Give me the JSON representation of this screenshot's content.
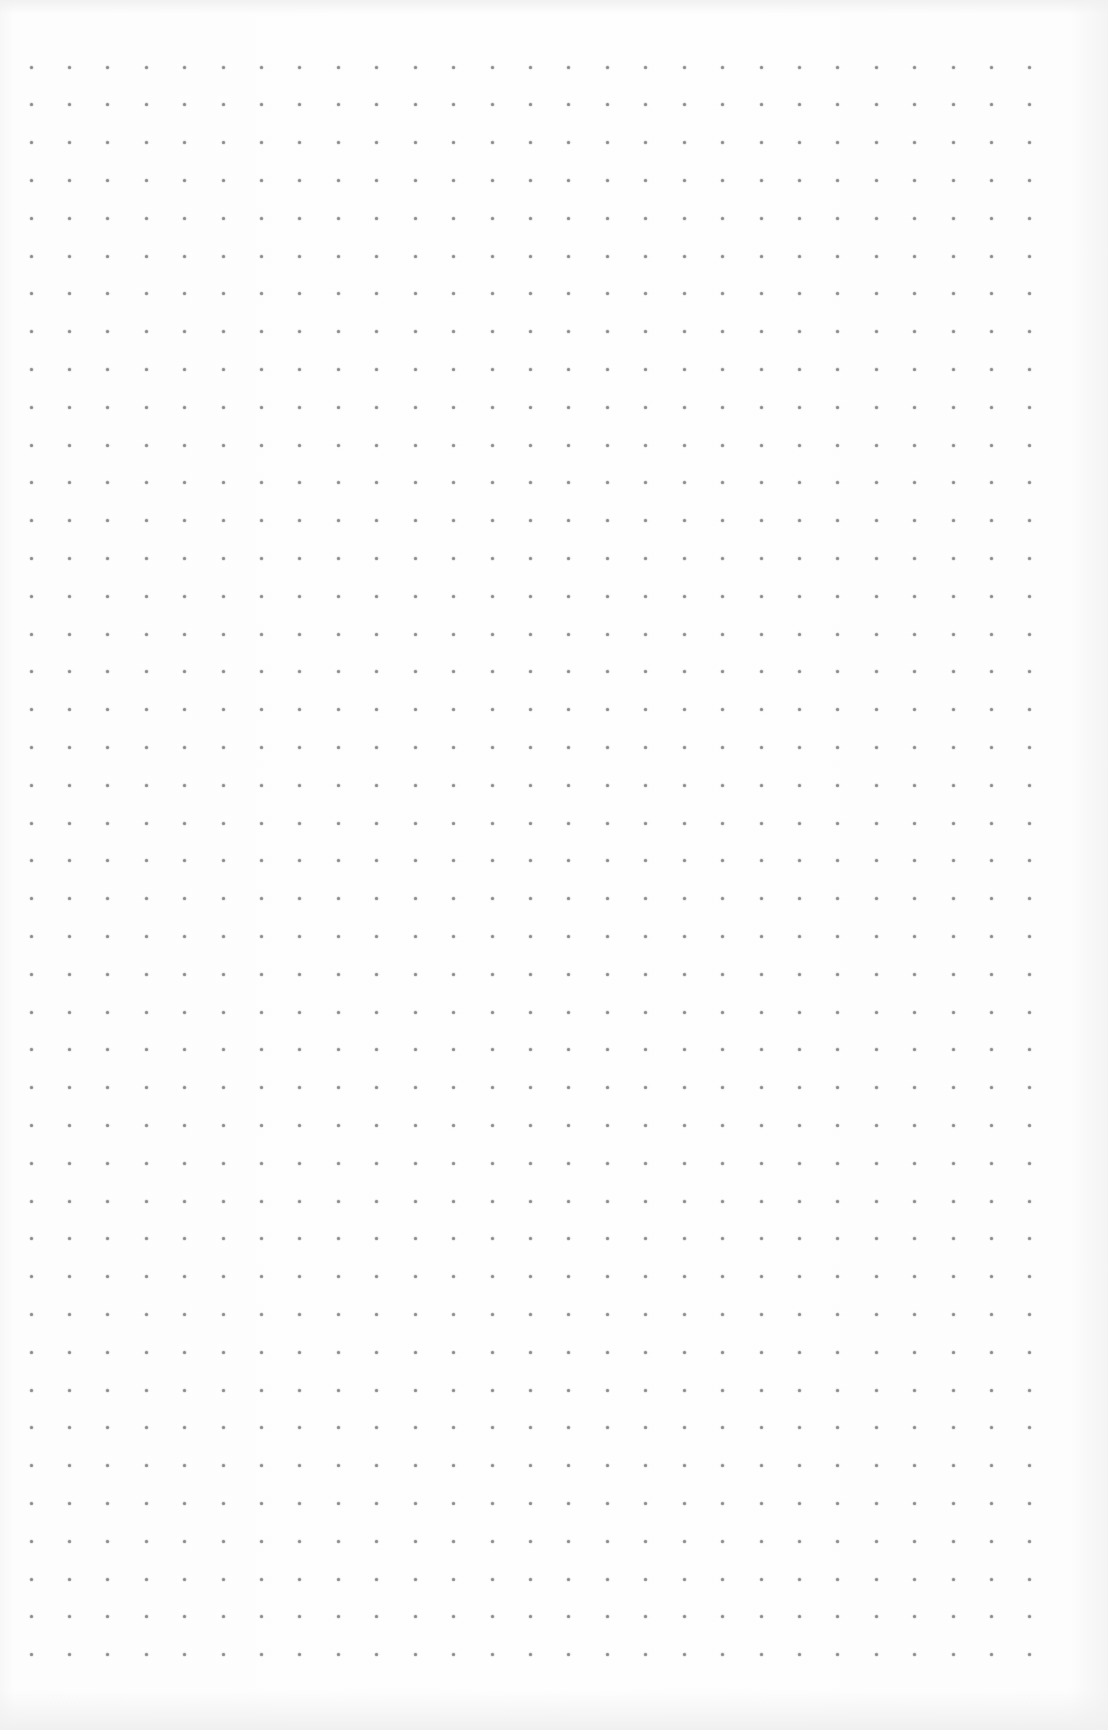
{
  "page": {
    "type": "dot-grid-paper",
    "background_color": "#fdfdfd",
    "dot_color": "#8c8c8c",
    "dot_size_px": 3
  },
  "grid": {
    "columns": 27,
    "rows": 43,
    "origin_x": 31,
    "origin_y": 67,
    "spacing_x": 38.42,
    "spacing_y": 37.8
  }
}
